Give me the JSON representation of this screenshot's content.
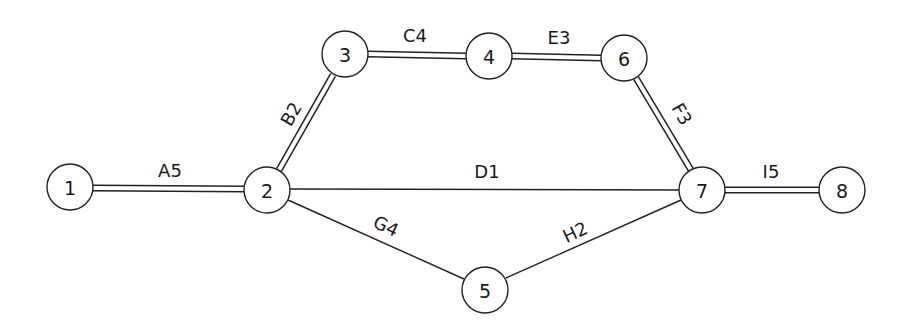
{
  "diagram": {
    "type": "activity-network",
    "nodes": [
      {
        "id": "1",
        "label": "1",
        "x": 70,
        "y": 187
      },
      {
        "id": "2",
        "label": "2",
        "x": 267,
        "y": 190
      },
      {
        "id": "3",
        "label": "3",
        "x": 345,
        "y": 54
      },
      {
        "id": "4",
        "label": "4",
        "x": 489,
        "y": 56
      },
      {
        "id": "5",
        "label": "5",
        "x": 485,
        "y": 290
      },
      {
        "id": "6",
        "label": "6",
        "x": 624,
        "y": 58
      },
      {
        "id": "7",
        "label": "7",
        "x": 702,
        "y": 190
      },
      {
        "id": "8",
        "label": "8",
        "x": 842,
        "y": 190
      }
    ],
    "edges": [
      {
        "id": "A",
        "label": "A5",
        "from": "1",
        "to": "2",
        "critical": true
      },
      {
        "id": "B",
        "label": "B2",
        "from": "2",
        "to": "3",
        "critical": true
      },
      {
        "id": "C",
        "label": "C4",
        "from": "3",
        "to": "4",
        "critical": true
      },
      {
        "id": "E",
        "label": "E3",
        "from": "4",
        "to": "6",
        "critical": true
      },
      {
        "id": "F",
        "label": "F3",
        "from": "6",
        "to": "7",
        "critical": true
      },
      {
        "id": "D",
        "label": "D1",
        "from": "2",
        "to": "7",
        "critical": false
      },
      {
        "id": "G",
        "label": "G4",
        "from": "2",
        "to": "5",
        "critical": false
      },
      {
        "id": "H",
        "label": "H2",
        "from": "5",
        "to": "7",
        "critical": false
      },
      {
        "id": "I",
        "label": "I5",
        "from": "7",
        "to": "8",
        "critical": true
      }
    ],
    "colors": {
      "stroke": "#222222",
      "background": "#ffffff",
      "text": "#1a1a1a"
    }
  }
}
